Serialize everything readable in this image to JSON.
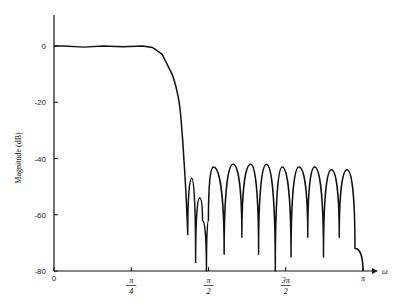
{
  "chart_data": {
    "type": "line",
    "title": "",
    "xlabel": "ω",
    "ylabel": "Magnitude (dB)",
    "ylim": [
      -80,
      10
    ],
    "xlim": [
      0,
      3.1416
    ],
    "grid": false,
    "legend": null,
    "y_ticks": [
      "0",
      "-20",
      "-40",
      "-60",
      "-80"
    ],
    "x_ticks": [
      {
        "num": "0",
        "den": ""
      },
      {
        "num": "π",
        "den": "4"
      },
      {
        "num": "π",
        "den": "2"
      },
      {
        "num": "3π",
        "den": "2"
      },
      {
        "num": "π",
        "den": ""
      }
    ],
    "series": [
      {
        "name": "magnitude response",
        "x": [
          0,
          0.1,
          0.3,
          0.5,
          0.7,
          0.9,
          1.0,
          1.1,
          1.2,
          1.25,
          1.28,
          1.3,
          1.32,
          1.36,
          1.4,
          1.44,
          1.48,
          1.51,
          1.55,
          1.57,
          1.62,
          1.73,
          1.82,
          1.91,
          2.0,
          2.08,
          2.16,
          2.25,
          2.32,
          2.41,
          2.49,
          2.58,
          2.65,
          2.74,
          2.82,
          2.9,
          2.98,
          3.06,
          3.1416
        ],
        "values": [
          0,
          0,
          -0.4,
          0,
          -0.3,
          0,
          -0.5,
          -3,
          -10,
          -16,
          -22,
          -30,
          -40,
          -67,
          -47,
          -77,
          -54,
          -62,
          -80,
          -62,
          -43,
          -74,
          -42,
          -68,
          -42,
          -74,
          -42,
          -80,
          -43,
          -75,
          -43,
          -68,
          -43,
          -75,
          -44,
          -68,
          -44,
          -72,
          -80
        ]
      }
    ]
  }
}
